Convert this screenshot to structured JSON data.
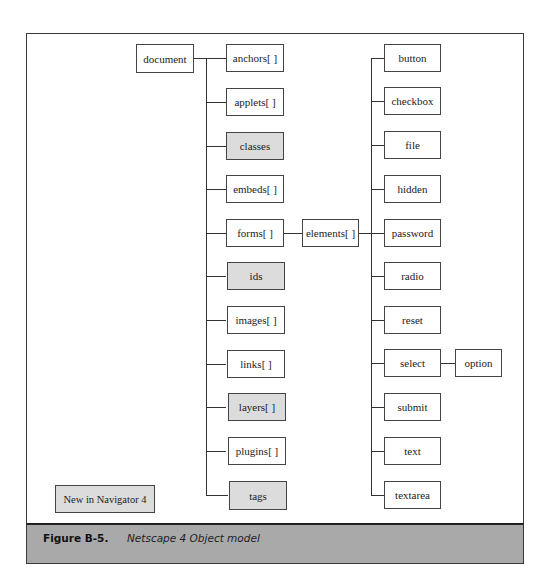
{
  "colors": {
    "new_fill": "#dcdcdc",
    "normal_fill": "#ffffff",
    "caption_bar": "#a9a9a9",
    "line": "#333333"
  },
  "diagram": {
    "root": "document",
    "document_children": [
      {
        "label": "anchors[ ]",
        "new": false
      },
      {
        "label": "applets[ ]",
        "new": false
      },
      {
        "label": "classes",
        "new": true
      },
      {
        "label": "embeds[ ]",
        "new": false
      },
      {
        "label": "forms[ ]",
        "new": false
      },
      {
        "label": "ids",
        "new": true
      },
      {
        "label": "images[ ]",
        "new": false
      },
      {
        "label": "links[ ]",
        "new": false
      },
      {
        "label": "layers[ ]",
        "new": true
      },
      {
        "label": "plugins[ ]",
        "new": false
      },
      {
        "label": "tags",
        "new": true
      }
    ],
    "forms_child": "elements[ ]",
    "elements_children": [
      {
        "label": "button"
      },
      {
        "label": "checkbox"
      },
      {
        "label": "file"
      },
      {
        "label": "hidden"
      },
      {
        "label": "password"
      },
      {
        "label": "radio"
      },
      {
        "label": "reset"
      },
      {
        "label": "select"
      },
      {
        "label": "submit"
      },
      {
        "label": "text"
      },
      {
        "label": "textarea"
      }
    ],
    "select_child": "option",
    "legend": "New in Navigator 4"
  },
  "caption": {
    "label": "Figure B-5.",
    "text": "Netscape 4 Object model"
  }
}
